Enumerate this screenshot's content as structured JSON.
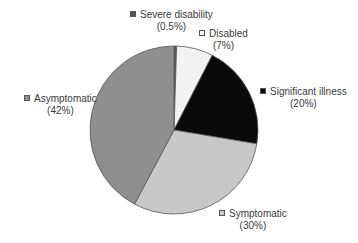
{
  "chart_data": {
    "type": "pie",
    "title": "",
    "start_angle_deg": 0,
    "direction": "clockwise",
    "slices": [
      {
        "label": "Severe disability",
        "value": 0.5,
        "pct_label": "(0.5%)",
        "color": "#555555"
      },
      {
        "label": "Disabled",
        "value": 7,
        "pct_label": "(7%)",
        "color": "#f2f2f2"
      },
      {
        "label": "Significant illness",
        "value": 20,
        "pct_label": "(20%)",
        "color": "#0a0a0a"
      },
      {
        "label": "Symptomatic",
        "value": 30,
        "pct_label": "(30%)",
        "color": "#c8c8c8"
      },
      {
        "label": "Asymptomatic",
        "value": 42,
        "pct_label": "(42%)",
        "color": "#8f8f8f"
      }
    ],
    "legend_position": "labels beside slices"
  }
}
